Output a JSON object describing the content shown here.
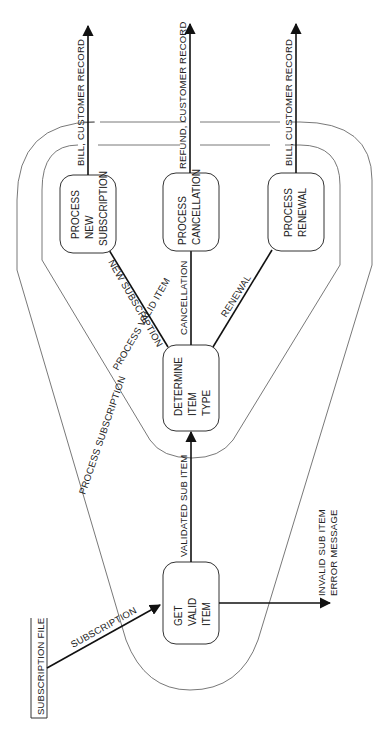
{
  "diagram": {
    "type": "data-flow-diagram",
    "orientation": "rotated-90-ccw",
    "external_entity": {
      "id": "subscription-file",
      "label": "SUBSCRIPTION FILE"
    },
    "processes": [
      {
        "id": "get-valid-item",
        "lines": [
          "GET",
          "VALID",
          "ITEM"
        ]
      },
      {
        "id": "determine-item-type",
        "lines": [
          "DETERMINE",
          "ITEM",
          "TYPE"
        ]
      },
      {
        "id": "process-new-subscription",
        "lines": [
          "PROCESS",
          "NEW",
          "SUBSCRIPTION"
        ]
      },
      {
        "id": "process-cancellation",
        "lines": [
          "PROCESS",
          "CANCELLATION"
        ]
      },
      {
        "id": "process-renewal",
        "lines": [
          "PROCESS",
          "RENEWAL"
        ]
      }
    ],
    "groupings": [
      {
        "id": "process-subscription",
        "label": "PROCESS SUBSCRIPTION"
      },
      {
        "id": "process-valid-item",
        "label": "PROCESS VALID ITEM"
      }
    ],
    "flows": [
      {
        "from": "subscription-file",
        "to": "get-valid-item",
        "label": "SUBSCRIPTION"
      },
      {
        "from": "get-valid-item",
        "to": "determine-item-type",
        "label": "VALIDATED SUB ITEM"
      },
      {
        "from": "get-valid-item",
        "to": "external",
        "label_lines": [
          "INVALID SUB ITEM",
          "ERROR MESSAGE"
        ]
      },
      {
        "from": "determine-item-type",
        "to": "process-new-subscription",
        "label": "NEW SUBSCRIPTION"
      },
      {
        "from": "determine-item-type",
        "to": "process-cancellation",
        "label": "CANCELLATION"
      },
      {
        "from": "determine-item-type",
        "to": "process-renewal",
        "label": "RENEWAL"
      },
      {
        "from": "process-new-subscription",
        "to": "external",
        "label": "BILL, CUSTOMER RECORD"
      },
      {
        "from": "process-cancellation",
        "to": "external",
        "label": "REFUND, CUSTOMER RECORD"
      },
      {
        "from": "process-renewal",
        "to": "external",
        "label": "BILL, CUSTOMER RECORD"
      }
    ]
  }
}
